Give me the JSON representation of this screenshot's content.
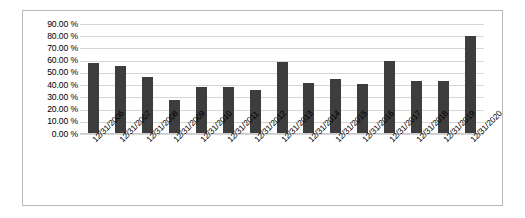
{
  "chart_data": {
    "type": "bar",
    "title": "",
    "xlabel": "",
    "ylabel": "",
    "categories": [
      "12/31/2006",
      "12/31/2007",
      "12/31/2008",
      "12/31/2009",
      "12/31/2010",
      "12/31/2011",
      "12/31/2012",
      "12/31/2013",
      "12/31/2014",
      "12/31/2015",
      "12/31/2016",
      "12/31/2017",
      "12/31/2018",
      "12/31/2019",
      "12/31/2020"
    ],
    "values": [
      58.5,
      56.0,
      47.0,
      28.0,
      38.5,
      38.5,
      36.0,
      59.0,
      42.0,
      45.0,
      41.0,
      59.5,
      43.5,
      43.0,
      80.0
    ],
    "ylim": [
      0,
      90
    ],
    "ytick_values": [
      90,
      80,
      70,
      60,
      50,
      40,
      30,
      20,
      10,
      0
    ],
    "ytick_labels": [
      "90.00 %",
      "80.00 %",
      "70.00 %",
      "60.00 %",
      "50.00 %",
      "40.00 %",
      "30.00 %",
      "20.00 %",
      "10.00 %",
      "0.00 %"
    ],
    "grid": true,
    "legend": false,
    "series_color": "#3d3d3d",
    "gridline_color": "#d6d6d6",
    "border_color": "#b9b9b9",
    "background_color": "#ffffff"
  }
}
